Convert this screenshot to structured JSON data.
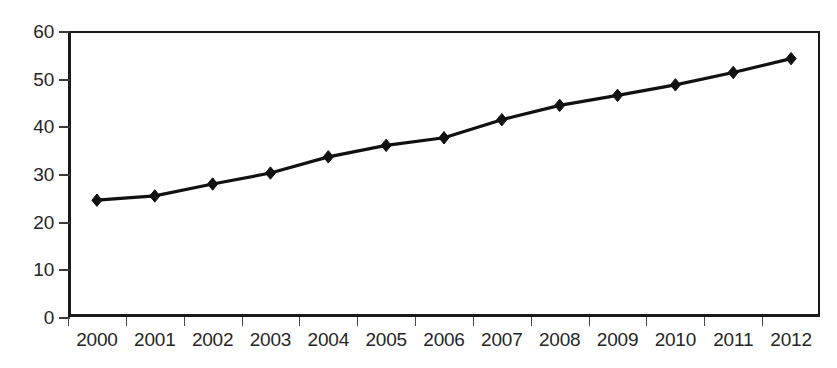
{
  "chart_data": {
    "type": "line",
    "title": "",
    "subtitle": "",
    "xlabel": "",
    "ylabel": "",
    "categories": [
      "2000",
      "2001",
      "2002",
      "2003",
      "2004",
      "2005",
      "2006",
      "2007",
      "2008",
      "2009",
      "2010",
      "2011",
      "2012"
    ],
    "values": [
      24.5,
      25.4,
      27.9,
      30.2,
      33.6,
      36.0,
      37.6,
      41.4,
      44.4,
      46.5,
      48.7,
      51.3,
      54.2
    ],
    "series": [
      {
        "name": "",
        "values": [
          24.5,
          25.4,
          27.9,
          30.2,
          33.6,
          36.0,
          37.6,
          41.4,
          44.4,
          46.5,
          48.7,
          51.3,
          54.2
        ]
      }
    ],
    "ylim": [
      0,
      60
    ],
    "ytick_labels": [
      "0",
      "10",
      "20",
      "30",
      "40",
      "50",
      "60"
    ],
    "ytick_values": [
      0,
      10,
      20,
      30,
      40,
      50,
      60
    ],
    "grid": true,
    "grid_axis": "y",
    "legend": false,
    "legend_position": "none",
    "marker": "diamond",
    "line_color": "#111111",
    "marker_color": "#111111",
    "grid_color": "#6e6e6e",
    "axis_color": "#1a1a1a",
    "text_color": "#262626",
    "background_color": "#ffffff",
    "annotations": []
  }
}
